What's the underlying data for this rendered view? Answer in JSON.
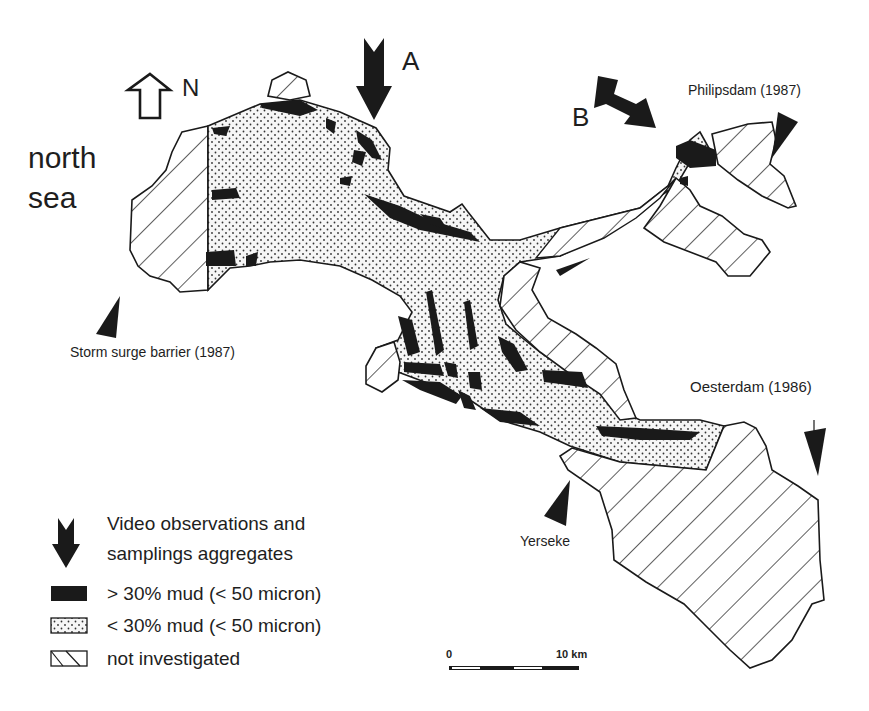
{
  "map": {
    "sea_label": [
      "north",
      "sea"
    ],
    "north_arrow_label": "N",
    "observation_arrows": [
      {
        "id": "A",
        "label": "A"
      },
      {
        "id": "B",
        "label": "B"
      }
    ],
    "places": [
      {
        "name": "Philipsdam (1987)"
      },
      {
        "name": "Storm surge barrier (1987)"
      },
      {
        "name": "Oesterdam (1986)"
      },
      {
        "name": "Yerseke"
      }
    ],
    "colors": {
      "ink": "#1a1a1a",
      "background": "#ffffff",
      "dot_fill": "#f4f4f4"
    }
  },
  "legend": {
    "items": [
      {
        "symbol": "down-arrow",
        "label_line1": "Video observations and",
        "label_line2": "samplings aggregates"
      },
      {
        "symbol": "solid-black",
        "label": "> 30% mud (< 50 micron)"
      },
      {
        "symbol": "dotted",
        "label": "< 30% mud (< 50 micron)"
      },
      {
        "symbol": "hatched",
        "label": "not investigated"
      }
    ]
  },
  "scale_bar": {
    "start_label": "0",
    "end_label": "10 km"
  }
}
